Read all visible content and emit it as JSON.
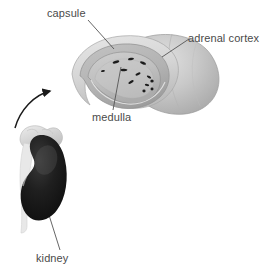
{
  "figure": {
    "background_color": "#ffffff",
    "labels": {
      "capsule": "capsule",
      "adrenal_cortex": "adrenal cortex",
      "medulla": "medulla",
      "kidney": "kidney"
    },
    "label_text_color": "#4a4a4a",
    "leader_line_color": "#555555",
    "arrow": {
      "name": "magnification-arrow",
      "direction": "curved-up-right",
      "color": "#1a1a1a"
    },
    "adrenal_gland_cutaway": {
      "outer_surface_color": "#c9c9c9",
      "capsule_color": "#d9d9d9",
      "cortex_color": "#b8b8b8",
      "medulla_color": "#a8a8a8",
      "medulla_lumen_color": "#c4c4c4",
      "medulla_spot_color": "#1c1c1c",
      "medulla_spot_count": 12
    },
    "kidney_inset": {
      "kidney_color": "#1a1a1a",
      "adrenal_cap_color": "#d0d0d0",
      "ureter_color": "#e2e2e2"
    }
  }
}
